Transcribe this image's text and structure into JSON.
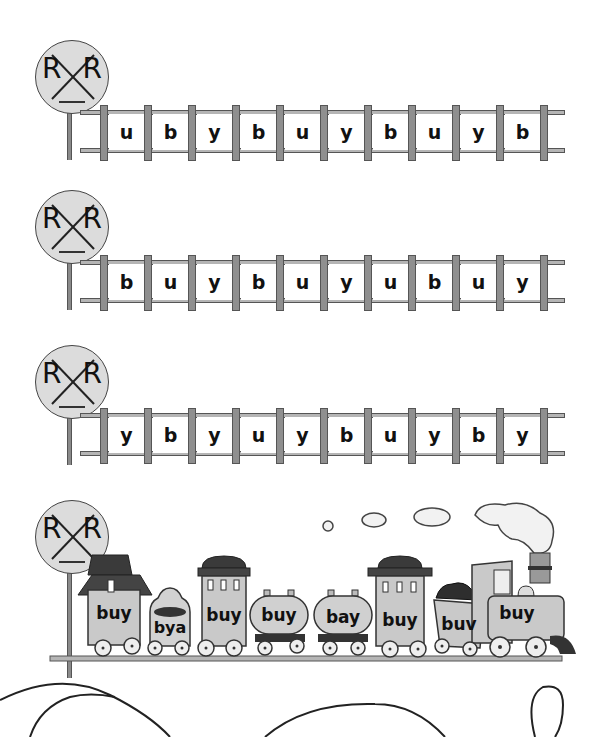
{
  "worksheet": {
    "signs": [
      {
        "left_letter": "R",
        "right_letter": "R"
      },
      {
        "left_letter": "R",
        "right_letter": "R"
      },
      {
        "left_letter": "R",
        "right_letter": "R"
      },
      {
        "left_letter": "R",
        "right_letter": "R"
      }
    ],
    "tracks": [
      {
        "letters": [
          "u",
          "b",
          "y",
          "b",
          "u",
          "y",
          "b",
          "u",
          "y",
          "b"
        ]
      },
      {
        "letters": [
          "b",
          "u",
          "y",
          "b",
          "u",
          "y",
          "u",
          "b",
          "u",
          "y"
        ]
      },
      {
        "letters": [
          "y",
          "b",
          "y",
          "u",
          "y",
          "b",
          "u",
          "y",
          "b",
          "y"
        ]
      }
    ],
    "train": {
      "cars": [
        {
          "type": "caboose",
          "label": "buy"
        },
        {
          "type": "hopper",
          "label": "bya"
        },
        {
          "type": "passenger-car",
          "label": "buy"
        },
        {
          "type": "tank-car",
          "label": "buy"
        },
        {
          "type": "tank-car",
          "label": "bay"
        },
        {
          "type": "passenger-car",
          "label": "buy"
        },
        {
          "type": "coal-car",
          "label": "buv"
        },
        {
          "type": "locomotive",
          "label": "buy"
        }
      ]
    },
    "colors": {
      "rail": "#b5b5b5",
      "tie": "#8f8f8f",
      "sign": "#dcdcdc",
      "outline": "#444444"
    }
  }
}
